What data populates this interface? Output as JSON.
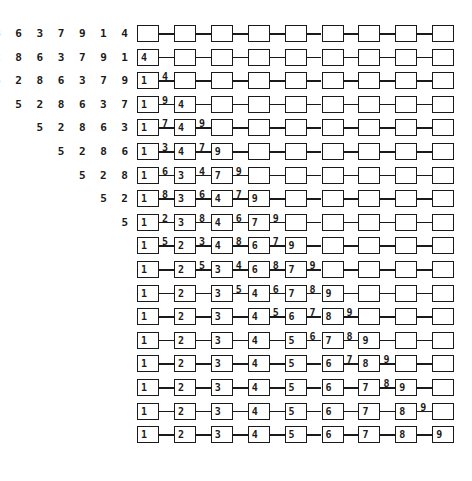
{
  "diagram": {
    "node_count": 9,
    "rows": [
      {
        "input": "5 2 8 6 3 7 9 1 4",
        "nodes": [
          "",
          "",
          "",
          "",
          "",
          "",
          "",
          "",
          ""
        ],
        "edges": [
          "",
          "",
          "",
          "",
          "",
          "",
          "",
          ""
        ]
      },
      {
        "input": "5 2 8 6 3 7 9 1",
        "nodes": [
          "4",
          "",
          "",
          "",
          "",
          "",
          "",
          "",
          ""
        ],
        "edges": [
          "",
          "",
          "",
          "",
          "",
          "",
          "",
          ""
        ]
      },
      {
        "input": "5 2 8 6 3 7 9",
        "nodes": [
          "1",
          "",
          "",
          "",
          "",
          "",
          "",
          "",
          ""
        ],
        "edges": [
          "4",
          "",
          "",
          "",
          "",
          "",
          "",
          ""
        ]
      },
      {
        "input": "5 2 8 6 3 7",
        "nodes": [
          "1",
          "4",
          "",
          "",
          "",
          "",
          "",
          "",
          ""
        ],
        "edges": [
          "9",
          "",
          "",
          "",
          "",
          "",
          "",
          ""
        ]
      },
      {
        "input": "5 2 8 6 3",
        "nodes": [
          "1",
          "4",
          "",
          "",
          "",
          "",
          "",
          "",
          ""
        ],
        "edges": [
          "7",
          "9",
          "",
          "",
          "",
          "",
          "",
          ""
        ]
      },
      {
        "input": "5 2 8 6",
        "nodes": [
          "1",
          "4",
          "9",
          "",
          "",
          "",
          "",
          "",
          ""
        ],
        "edges": [
          "3",
          "7",
          "",
          "",
          "",
          "",
          "",
          ""
        ]
      },
      {
        "input": "5 2 8",
        "nodes": [
          "1",
          "3",
          "7",
          "",
          "",
          "",
          "",
          "",
          ""
        ],
        "edges": [
          "6",
          "4",
          "9",
          "",
          "",
          "",
          "",
          ""
        ]
      },
      {
        "input": "5 2",
        "nodes": [
          "1",
          "3",
          "4",
          "9",
          "",
          "",
          "",
          "",
          ""
        ],
        "edges": [
          "8",
          "6",
          "7",
          "",
          "",
          "",
          "",
          ""
        ]
      },
      {
        "input": "5",
        "nodes": [
          "1",
          "3",
          "4",
          "7",
          "",
          "",
          "",
          "",
          ""
        ],
        "edges": [
          "2",
          "8",
          "6",
          "9",
          "",
          "",
          "",
          ""
        ]
      },
      {
        "input": "",
        "nodes": [
          "1",
          "2",
          "4",
          "6",
          "9",
          "",
          "",
          "",
          ""
        ],
        "edges": [
          "5",
          "3",
          "8",
          "7",
          "",
          "",
          "",
          ""
        ]
      },
      {
        "input": "",
        "nodes": [
          "1",
          "2",
          "3",
          "6",
          "7",
          "",
          "",
          "",
          ""
        ],
        "edges": [
          "",
          "5",
          "4",
          "8",
          "9",
          "",
          "",
          ""
        ]
      },
      {
        "input": "",
        "nodes": [
          "1",
          "2",
          "3",
          "4",
          "7",
          "9",
          "",
          "",
          ""
        ],
        "edges": [
          "",
          "",
          "5",
          "6",
          "8",
          "",
          "",
          ""
        ]
      },
      {
        "input": "",
        "nodes": [
          "1",
          "2",
          "3",
          "4",
          "6",
          "8",
          "",
          "",
          ""
        ],
        "edges": [
          "",
          "",
          "",
          "5",
          "7",
          "9",
          "",
          ""
        ]
      },
      {
        "input": "",
        "nodes": [
          "1",
          "2",
          "3",
          "4",
          "5",
          "7",
          "9",
          "",
          ""
        ],
        "edges": [
          "",
          "",
          "",
          "",
          "6",
          "8",
          "",
          ""
        ]
      },
      {
        "input": "",
        "nodes": [
          "1",
          "2",
          "3",
          "4",
          "5",
          "6",
          "8",
          "",
          ""
        ],
        "edges": [
          "",
          "",
          "",
          "",
          "",
          "7",
          "9",
          ""
        ]
      },
      {
        "input": "",
        "nodes": [
          "1",
          "2",
          "3",
          "4",
          "5",
          "6",
          "7",
          "9",
          ""
        ],
        "edges": [
          "",
          "",
          "",
          "",
          "",
          "",
          "8",
          ""
        ]
      },
      {
        "input": "",
        "nodes": [
          "1",
          "2",
          "3",
          "4",
          "5",
          "6",
          "7",
          "8",
          ""
        ],
        "edges": [
          "",
          "",
          "",
          "",
          "",
          "",
          "",
          "9"
        ]
      },
      {
        "input": "",
        "nodes": [
          "1",
          "2",
          "3",
          "4",
          "5",
          "6",
          "7",
          "8",
          "9"
        ],
        "edges": [
          "",
          "",
          "",
          "",
          "",
          "",
          "",
          ""
        ]
      }
    ]
  }
}
